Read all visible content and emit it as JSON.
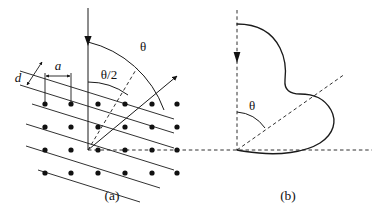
{
  "figure": {
    "background_color": "#ffffff",
    "ink_color": "#111111",
    "width": 372,
    "height": 216
  },
  "panels": [
    {
      "id": "a",
      "caption": "(a)",
      "description": "Incident beam striking a two-dimensional lattice of atoms; scattered beam leaves at angle theta from the incident direction.",
      "labels": {
        "interplanar_spacing": "d",
        "atomic_spacing": "a",
        "scattering_angle": "θ",
        "half_angle": "θ/2"
      },
      "elements": {
        "incident_beam": "vertical downward arrow",
        "scattered_beam": "arrow up and to the right",
        "bisector": "dashed line along theta/2 direction",
        "horizontal_reference": "dashed horizontal line from scattering origin",
        "lattice": "rows of filled circles connected by parallel lines sloping down to the right"
      }
    },
    {
      "id": "b",
      "caption": "(b)",
      "description": "Polar plot of scattered intensity versus angle, with a dashed radial line at angle theta from the incident direction.",
      "labels": {
        "scattering_angle": "θ"
      },
      "elements": {
        "incident_axis": "dashed vertical axis with downward arrow",
        "horizontal_axis": "dashed horizontal axis",
        "radial_line": "dashed diagonal line at angle theta",
        "intensity_curve": "closed lobed curve from the vertical axis around to the origin"
      }
    }
  ],
  "symbols": {
    "theta": "θ",
    "theta_half": "θ/2",
    "d": "d",
    "a": "a"
  },
  "captions": {
    "panel_a": "(a)",
    "panel_b": "(b)"
  }
}
